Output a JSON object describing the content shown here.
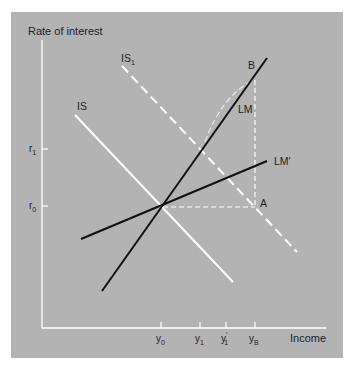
{
  "diagram": {
    "axes": {
      "y_label": "Rate of interest",
      "x_label": "Income",
      "y_ticks": [
        {
          "base": "r",
          "sub": "1",
          "label": "r1"
        },
        {
          "base": "r",
          "sub": "0",
          "label": "r0"
        }
      ],
      "x_ticks": [
        {
          "base": "y",
          "sub": "0",
          "prime": "",
          "label": "y0"
        },
        {
          "base": "y",
          "sub": "1",
          "prime": "",
          "label": "y1"
        },
        {
          "base": "y",
          "sub": "1",
          "prime": "′",
          "label": "y1'"
        },
        {
          "base": "y",
          "sub": "B",
          "prime": "",
          "label": "yB"
        }
      ]
    },
    "curves": {
      "is": {
        "base": "IS",
        "sub": "",
        "color": "#ffffff",
        "style": "solid"
      },
      "is1": {
        "base": "IS",
        "sub": "1",
        "color": "#ffffff",
        "style": "dashed"
      },
      "lm": {
        "base": "LM",
        "prime": "",
        "color": "#111111",
        "style": "solid"
      },
      "lm_prime": {
        "base": "LM",
        "prime": "′",
        "color": "#111111",
        "style": "solid"
      }
    },
    "points": {
      "a": "A",
      "b": "B"
    },
    "colors": {
      "panel_bg": "#b3b3b3",
      "axis": "#ffffff",
      "dark_line": "#111111",
      "light_line": "#ffffff"
    }
  }
}
